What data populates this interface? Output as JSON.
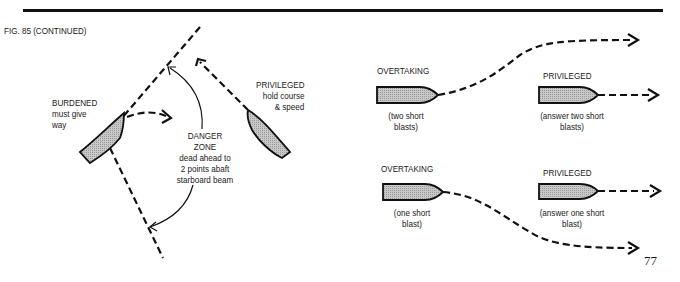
{
  "figure": {
    "caption": "FIG. 85 (CONTINUED)",
    "page_number": "77"
  },
  "crossing": {
    "burdened": {
      "title": "BURDENED",
      "line1": "must give",
      "line2": "way"
    },
    "privileged": {
      "title": "PRIVILEGED",
      "line1": "hold course",
      "line2": "& speed"
    },
    "danger_zone": {
      "line1": "DANGER",
      "line2": "ZONE",
      "line3": "dead ahead to",
      "line4": "2 points abaft",
      "line5": "starboard beam"
    }
  },
  "overtaking_starboard": {
    "overtaking": {
      "title": "OVERTAKING",
      "line1": "(two short",
      "line2": "blasts)"
    },
    "privileged": {
      "title": "PRIVILEGED",
      "line1": "(answer two short",
      "line2": "blasts)"
    }
  },
  "overtaking_port": {
    "overtaking": {
      "title": "OVERTAKING",
      "line1": "(one short",
      "line2": "blast)"
    },
    "privileged": {
      "title": "PRIVILEGED",
      "line1": "(answer one short",
      "line2": "blast)"
    }
  },
  "colors": {
    "ink": "#111111",
    "hull_fill": "#bdbdbd"
  }
}
